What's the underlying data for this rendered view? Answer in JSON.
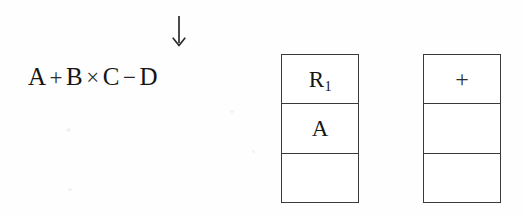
{
  "diagram": {
    "background_color": "#fefefe",
    "ink_color": "#161616",
    "border_color": "#3a3a3a"
  },
  "expression": {
    "full_text": "A + B × C − D",
    "tokens": [
      {
        "text": "A",
        "kind": "operand"
      },
      {
        "text": "+",
        "kind": "operator"
      },
      {
        "text": "B",
        "kind": "operand"
      },
      {
        "text": "×",
        "kind": "operator"
      },
      {
        "text": "C",
        "kind": "operand"
      },
      {
        "text": "−",
        "kind": "operator"
      },
      {
        "text": "D",
        "kind": "operand"
      }
    ]
  },
  "pointer": {
    "icon": "down-arrow-icon",
    "glyph": "↓",
    "points_to_token": "×",
    "label": ""
  },
  "stacks": [
    {
      "name": "register-stack",
      "cells": [
        {
          "text": "R₁1",
          "base": "R",
          "subscript": "1",
          "empty": false
        },
        {
          "text": "A",
          "base": "A",
          "subscript": "",
          "empty": false
        },
        {
          "text": "",
          "base": "",
          "subscript": "",
          "empty": true
        }
      ]
    },
    {
      "name": "operator-stack",
      "cells": [
        {
          "text": "+",
          "base": "+",
          "subscript": "",
          "empty": false
        },
        {
          "text": "",
          "base": "",
          "subscript": "",
          "empty": true
        },
        {
          "text": "",
          "base": "",
          "subscript": "",
          "empty": true
        }
      ]
    }
  ]
}
